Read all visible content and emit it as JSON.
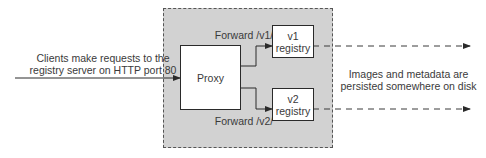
{
  "diagram": {
    "input_label": {
      "line1": "Clients make requests to the",
      "line2": "registry server on HTTP port 80"
    },
    "proxy": {
      "label": "Proxy"
    },
    "route_v1": {
      "label": "Forward /v1/"
    },
    "route_v2": {
      "label": "Forward /v2/"
    },
    "registry_v1": {
      "line1": "v1",
      "line2": "registry"
    },
    "registry_v2": {
      "line1": "v2",
      "line2": "registry"
    },
    "storage_label": {
      "line1": "Images and metadata are",
      "line2": "persisted somewhere on disk"
    },
    "colors": {
      "region_fill": "#d2d2d2",
      "box_fill": "#ffffff",
      "line": "#2a2a2a",
      "text": "#3a3a3a"
    }
  }
}
